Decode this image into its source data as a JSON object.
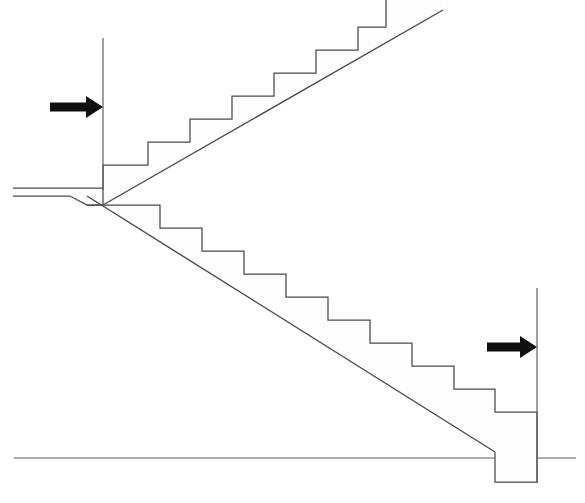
{
  "figure": {
    "kind": "architectural-section-diagram",
    "width": 585,
    "height": 503,
    "background_color": "#ffffff",
    "line_color": "#4a4a4a",
    "arrow_color": "#101010",
    "hatch_color": "#2b2b2b",
    "caption": "",
    "labels": []
  },
  "annotations": {
    "arrow_left": {
      "name": "load-arrow-left",
      "direction": "right",
      "label": "",
      "tail_x": 50,
      "tip_x": 103,
      "y": 107
    },
    "arrow_right": {
      "name": "load-arrow-right",
      "direction": "right",
      "label": "",
      "tail_x": 487,
      "tip_x": 537,
      "y": 347
    }
  },
  "reference_lines": {
    "upper_wall": {
      "x": 103,
      "y1": 38,
      "y2": 190
    },
    "lower_wall": {
      "x": 537,
      "y1": 288,
      "y2": 483
    },
    "floor_left": {
      "y": 458,
      "x1": 14,
      "x2": 495
    },
    "floor_right": {
      "y": 458,
      "x1": 537,
      "x2": 576
    }
  },
  "geometry": {
    "upper_flight": {
      "name": "upper-stair-flight",
      "direction": "ascending-right",
      "step_count": 7,
      "tread_width": 42,
      "riser_height": 23,
      "start_x": 103,
      "start_y": 165,
      "soffit_from": [
        103,
        205
      ],
      "soffit_to": [
        443,
        10
      ],
      "outline": "M 103 205 L 103 165 L 148 165 L 148 142 L 190 142 L 190 119 L 232 119 L 232 96 L 274 96 L 274 73 L 316 73 L 316 50 L 358 50 L 358 27 L 386 27 L 386 0 L 443 0 L 443 10 Z"
    },
    "lower_flight": {
      "name": "lower-stair-flight",
      "direction": "descending-right",
      "step_count": 7,
      "tread_width": 42,
      "riser_height": 23,
      "start_x": 103,
      "start_y": 210,
      "soffit_from": [
        87,
        196
      ],
      "soffit_to": [
        495,
        452
      ],
      "outline": "M 103 205 L 160 205 L 160 228 L 202 228 L 202 251 L 244 251 L 244 274 L 286 274 L 286 297 L 328 297 L 328 320 L 370 320 L 370 343 L 412 343 L 412 366 L 454 366 L 454 389 L 495 389 L 495 412 L 537 412 L 537 482 L 495 482 L 495 452 Z"
    },
    "landing_slab": {
      "name": "landing-slab",
      "left_x": 13,
      "top_y": 188,
      "bottom_y": 205,
      "outline": "M 13 188 L 103 188 L 103 205 L 87 205 L 70 196 L 13 196 Z"
    }
  }
}
